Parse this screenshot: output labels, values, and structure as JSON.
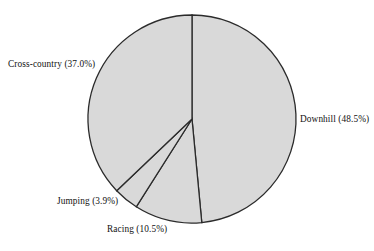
{
  "chart_data": {
    "type": "pie",
    "title": "",
    "subtitle": "",
    "xlabel": "",
    "ylabel": "",
    "legend_position": "none",
    "grid": false,
    "units": "percent",
    "start_angle_deg": 90,
    "direction": "clockwise",
    "categories": [
      "Downhill",
      "Racing",
      "Jumping",
      "Cross-country"
    ],
    "values": [
      48.5,
      10.5,
      3.9,
      37.0
    ],
    "labels": [
      "Downhill (48.5%)",
      "Racing (10.5%)",
      "Jumping (3.9%)",
      "Cross-country (37.0%)"
    ],
    "slices": [
      {
        "name": "Downhill",
        "label": "Downhill (48.5%)",
        "value": 48.5,
        "percent": "48.5%",
        "start_deg": 0.0,
        "end_deg": 174.6,
        "fill": "#d9d9d9",
        "stroke": "#2b2b2b",
        "label_x": 300,
        "label_y": 114
      },
      {
        "name": "Racing",
        "label": "Racing (10.5%)",
        "value": 10.5,
        "percent": "10.5%",
        "start_deg": 174.6,
        "end_deg": 212.4,
        "fill": "#d9d9d9",
        "stroke": "#2b2b2b",
        "label_x": 107,
        "label_y": 224
      },
      {
        "name": "Jumping",
        "label": "Jumping (3.9%)",
        "value": 3.9,
        "percent": "3.9%",
        "start_deg": 212.4,
        "end_deg": 226.4,
        "fill": "#d9d9d9",
        "stroke": "#2b2b2b",
        "label_x": 57,
        "label_y": 196
      },
      {
        "name": "Cross-country",
        "label": "Cross-country (37.0%)",
        "value": 37.0,
        "percent": "37.0%",
        "start_deg": 226.4,
        "end_deg": 360.0,
        "fill": "#d9d9d9",
        "stroke": "#2b2b2b",
        "label_x": 8,
        "label_y": 59
      }
    ],
    "geometry": {
      "center_x": 192,
      "center_y": 119,
      "radius": 104
    },
    "colors": {
      "background": "#ffffff",
      "slice_fill": "#d9d9d9",
      "slice_stroke": "#2b2b2b",
      "text": "#111111"
    }
  }
}
